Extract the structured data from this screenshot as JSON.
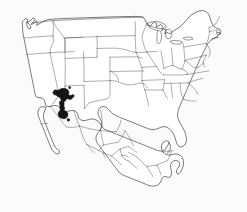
{
  "figure": {
    "kind": "species-distribution-map",
    "region": "North America",
    "background_color": "#fbfbfb",
    "outline_color": "#2b2b2b",
    "internal_border_color": "#4a4a4a",
    "range_fill_color": "#141414",
    "width": 247,
    "height": 212,
    "title": "",
    "caption": "",
    "legend": "",
    "scale_bar": "",
    "north_arrow": ""
  },
  "layers": {
    "country_outline": {
      "name": "North America coastline and national borders",
      "visible": true
    },
    "us_states": {
      "name": "United States state boundaries",
      "visible": true
    },
    "mexico_states": {
      "name": "Mexico state boundaries",
      "visible": true
    },
    "canada_border": {
      "name": "Canada - United States border",
      "visible": true
    },
    "distribution_range": {
      "name": "Shaded distribution range",
      "visible": true,
      "description": "Solid black range in western Arizona, southeastern California and northwestern Sonora"
    }
  },
  "range": {
    "fill": "#141414",
    "label": "",
    "approx_extent_px": {
      "x_min": 52,
      "x_max": 74,
      "y_min": 88,
      "y_max": 122
    }
  }
}
